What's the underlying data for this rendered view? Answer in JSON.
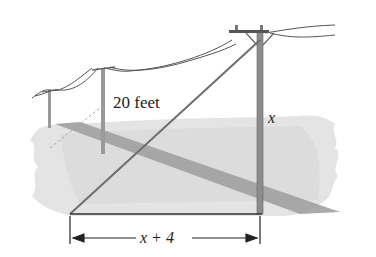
{
  "diagram": {
    "type": "right-triangle word problem illustration",
    "labels": {
      "hypotenuse": "20 feet",
      "vertical_side": "x",
      "horizontal_side": "x + 4"
    },
    "colors": {
      "ground": "#d6d6d6",
      "ground_light": "#e6e6e6",
      "road": "#9a9a9a",
      "pole": "#8c8c8c",
      "wire": "#555555",
      "triangle": "#444444",
      "guy_wire": "#777777"
    }
  }
}
